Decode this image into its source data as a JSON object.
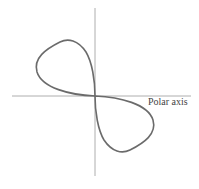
{
  "diagram": {
    "type": "polar-curve",
    "axis_label": "Polar axis",
    "colors": {
      "curve": "#6b6b6b",
      "axes": "#9a9a9a",
      "label": "#444444"
    }
  }
}
